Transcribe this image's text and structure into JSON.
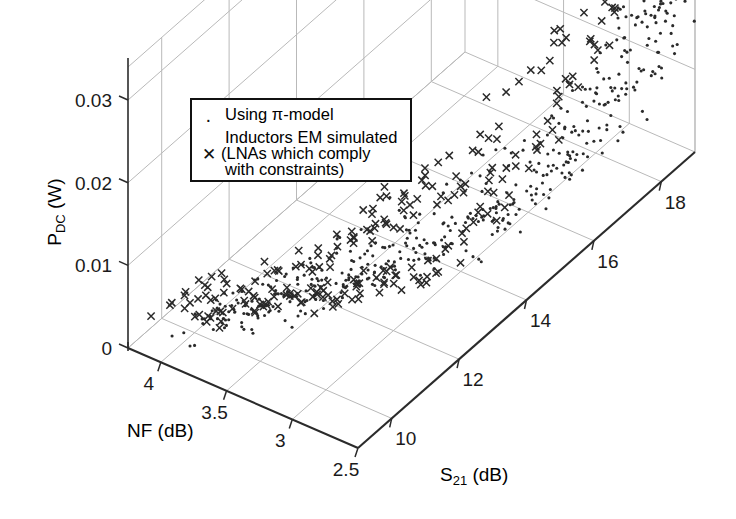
{
  "figure": {
    "kind": "3d-scatter-plot",
    "background": "#ffffff",
    "ink": "#1a1a1a",
    "grid_color": "#b9b9b9",
    "axis_color": "#2b2b2b"
  },
  "axes": {
    "x": {
      "label": "NF (dB)",
      "ticks": [
        "4",
        "3.5",
        "3",
        "2.5"
      ],
      "values": [
        4,
        3.5,
        3,
        2.5
      ],
      "range": [
        4.25,
        2.5
      ]
    },
    "y": {
      "label_main": "S",
      "label_sub": "21",
      "label_unit": " (dB)",
      "label": "S21 (dB)",
      "ticks": [
        "10",
        "12",
        "14",
        "16",
        "18"
      ],
      "values": [
        10,
        12,
        14,
        16,
        18
      ],
      "range": [
        9,
        19
      ]
    },
    "z": {
      "label_main": "P",
      "label_sub": "DC",
      "label_unit": " (W)",
      "label": "PDC (W)",
      "ticks": [
        "0",
        "0.01",
        "0.02",
        "0.03"
      ],
      "values": [
        0,
        0.01,
        0.02,
        0.03
      ],
      "range": [
        0,
        0.034
      ]
    }
  },
  "legend": {
    "box": true,
    "entries": [
      {
        "marker": "dot",
        "text": "Using π-model"
      },
      {
        "marker": "cross",
        "text": "Inductors EM simulated"
      },
      {
        "marker": "none",
        "text": "(LNAs which comply"
      },
      {
        "marker": "none",
        "text": "with constraints)"
      }
    ],
    "line1": "Using π-model",
    "line2": "Inductors EM simulated",
    "line3": "(LNAs which comply",
    "line4": "with constraints)"
  },
  "chart_data": {
    "type": "scatter",
    "projection": "3d",
    "title": "",
    "xlabel": "NF (dB)",
    "ylabel": "S21 (dB)",
    "zlabel": "PDC (W)",
    "xlim": [
      4.25,
      2.5
    ],
    "ylim": [
      9,
      19
    ],
    "zlim": [
      0,
      0.034
    ],
    "grid": true,
    "legend_position": "upper-left-inside",
    "series": [
      {
        "name": "Using π-model",
        "marker": "dot",
        "color": "#2a2a2a",
        "points": [
          [
            3.95,
            10.3,
            0.0008
          ],
          [
            3.9,
            10.6,
            0.0009
          ],
          [
            3.86,
            10.9,
            0.001
          ],
          [
            3.82,
            10.4,
            0.0007
          ],
          [
            3.78,
            11.2,
            0.0011
          ],
          [
            3.74,
            11.5,
            0.0012
          ],
          [
            3.7,
            10.8,
            0.0009
          ],
          [
            3.66,
            11.8,
            0.0013
          ],
          [
            3.62,
            12.1,
            0.0014
          ],
          [
            3.58,
            11.4,
            0.0011
          ],
          [
            3.54,
            12.4,
            0.0015
          ],
          [
            3.5,
            12.7,
            0.0016
          ],
          [
            3.46,
            12.0,
            0.0013
          ],
          [
            3.42,
            13.0,
            0.0017
          ],
          [
            3.38,
            13.3,
            0.0018
          ],
          [
            3.34,
            12.6,
            0.0015
          ],
          [
            3.3,
            13.6,
            0.0019
          ],
          [
            3.26,
            13.9,
            0.002
          ],
          [
            3.22,
            13.2,
            0.0017
          ],
          [
            3.18,
            14.2,
            0.0022
          ],
          [
            3.14,
            14.5,
            0.0024
          ],
          [
            3.1,
            13.8,
            0.0019
          ],
          [
            3.06,
            14.8,
            0.0026
          ],
          [
            3.02,
            15.1,
            0.0029
          ],
          [
            2.98,
            14.4,
            0.0023
          ],
          [
            2.96,
            15.4,
            0.0032
          ],
          [
            2.94,
            15.7,
            0.0036
          ],
          [
            2.92,
            15.0,
            0.0028
          ],
          [
            2.9,
            16.0,
            0.0041
          ],
          [
            2.88,
            16.3,
            0.0047
          ],
          [
            2.86,
            15.6,
            0.0035
          ],
          [
            2.84,
            16.6,
            0.0055
          ],
          [
            2.82,
            16.9,
            0.0064
          ],
          [
            2.8,
            16.2,
            0.0045
          ],
          [
            2.78,
            17.2,
            0.0075
          ],
          [
            2.76,
            17.4,
            0.0086
          ],
          [
            2.74,
            16.8,
            0.0062
          ],
          [
            2.72,
            17.6,
            0.0098
          ],
          [
            2.7,
            17.8,
            0.0112
          ],
          [
            2.68,
            17.1,
            0.0072
          ],
          [
            2.66,
            18.0,
            0.0128
          ],
          [
            2.64,
            18.2,
            0.0145
          ],
          [
            2.62,
            17.5,
            0.009
          ],
          [
            2.6,
            18.3,
            0.0162
          ],
          [
            2.58,
            18.4,
            0.018
          ],
          [
            2.56,
            18.0,
            0.0135
          ],
          [
            2.55,
            18.5,
            0.0198
          ],
          [
            2.54,
            18.6,
            0.0215
          ],
          [
            2.53,
            18.3,
            0.017
          ],
          [
            2.52,
            18.7,
            0.0232
          ],
          [
            2.52,
            18.7,
            0.025
          ],
          [
            2.51,
            18.5,
            0.0205
          ],
          [
            2.51,
            18.8,
            0.0268
          ],
          [
            2.5,
            18.8,
            0.0285
          ],
          [
            2.5,
            18.6,
            0.024
          ],
          [
            2.5,
            18.9,
            0.03
          ],
          [
            2.5,
            18.9,
            0.0312
          ],
          [
            2.51,
            18.7,
            0.0275
          ],
          [
            2.52,
            18.8,
            0.0322
          ],
          [
            2.53,
            18.6,
            0.033
          ],
          [
            3.92,
            11.0,
            0.0012
          ],
          [
            3.84,
            11.6,
            0.0013
          ],
          [
            3.76,
            12.2,
            0.0014
          ],
          [
            3.68,
            12.8,
            0.0016
          ],
          [
            3.6,
            13.4,
            0.0018
          ],
          [
            3.52,
            14.0,
            0.0021
          ],
          [
            3.44,
            14.6,
            0.0025
          ],
          [
            3.36,
            15.2,
            0.003
          ],
          [
            3.28,
            15.8,
            0.0037
          ],
          [
            3.2,
            16.4,
            0.0048
          ],
          [
            3.12,
            16.9,
            0.006
          ],
          [
            3.04,
            17.3,
            0.0076
          ],
          [
            2.97,
            17.7,
            0.0095
          ],
          [
            2.91,
            18.0,
            0.0118
          ],
          [
            2.85,
            18.2,
            0.0142
          ],
          [
            2.79,
            18.4,
            0.0168
          ],
          [
            2.73,
            18.5,
            0.0195
          ],
          [
            2.68,
            18.6,
            0.0222
          ],
          [
            2.63,
            18.7,
            0.0248
          ],
          [
            2.59,
            18.8,
            0.0272
          ],
          [
            3.99,
            10.1,
            0.0006
          ],
          [
            3.93,
            10.2,
            0.0007
          ],
          [
            3.87,
            10.5,
            0.0008
          ],
          [
            3.81,
            10.7,
            0.0008
          ],
          [
            3.75,
            11.1,
            0.001
          ],
          [
            3.69,
            11.3,
            0.001
          ],
          [
            3.63,
            11.7,
            0.0012
          ],
          [
            3.57,
            12.0,
            0.0013
          ],
          [
            3.51,
            12.3,
            0.0014
          ],
          [
            3.45,
            12.5,
            0.0015
          ],
          [
            3.39,
            12.9,
            0.0016
          ],
          [
            3.33,
            13.1,
            0.0017
          ],
          [
            3.27,
            13.5,
            0.0019
          ],
          [
            3.21,
            13.7,
            0.002
          ],
          [
            3.15,
            14.1,
            0.0022
          ],
          [
            3.09,
            14.3,
            0.0023
          ],
          [
            3.03,
            14.7,
            0.0027
          ],
          [
            2.99,
            15.3,
            0.0031
          ],
          [
            2.95,
            15.9,
            0.0039
          ],
          [
            2.93,
            16.5,
            0.0052
          ],
          [
            2.89,
            17.0,
            0.0068
          ],
          [
            2.87,
            17.5,
            0.0089
          ],
          [
            2.83,
            17.9,
            0.011
          ],
          [
            2.81,
            18.1,
            0.0132
          ],
          [
            2.77,
            18.3,
            0.0158
          ],
          [
            2.75,
            18.4,
            0.0185
          ],
          [
            2.71,
            18.5,
            0.021
          ],
          [
            2.69,
            18.6,
            0.0236
          ],
          [
            2.67,
            18.7,
            0.026
          ],
          [
            2.65,
            18.8,
            0.029
          ],
          [
            2.61,
            18.8,
            0.0308
          ],
          [
            2.57,
            18.9,
            0.0326
          ]
        ]
      },
      {
        "name": "Inductors EM simulated (LNAs which comply with constraints)",
        "marker": "cross",
        "color": "#2a2a2a",
        "points": [
          [
            4.22,
            10.2,
            0.001
          ],
          [
            4.15,
            10.3,
            0.0011
          ],
          [
            4.08,
            10.5,
            0.0012
          ],
          [
            4.02,
            10.4,
            0.001
          ],
          [
            3.96,
            10.7,
            0.0013
          ],
          [
            3.92,
            10.6,
            0.0011
          ],
          [
            3.88,
            10.9,
            0.0014
          ],
          [
            3.84,
            10.8,
            0.0012
          ],
          [
            3.8,
            11.1,
            0.0015
          ],
          [
            3.76,
            11.0,
            0.0013
          ],
          [
            3.72,
            11.3,
            0.0016
          ],
          [
            3.68,
            11.2,
            0.0014
          ],
          [
            3.64,
            11.5,
            0.0017
          ],
          [
            3.6,
            11.4,
            0.0015
          ],
          [
            3.56,
            11.7,
            0.0018
          ],
          [
            3.52,
            11.6,
            0.0016
          ],
          [
            3.48,
            11.9,
            0.0019
          ],
          [
            3.44,
            11.8,
            0.0017
          ],
          [
            3.4,
            12.1,
            0.002
          ],
          [
            3.36,
            12.0,
            0.0018
          ],
          [
            3.32,
            12.3,
            0.0022
          ],
          [
            3.28,
            12.2,
            0.0019
          ],
          [
            3.24,
            12.5,
            0.0024
          ],
          [
            3.2,
            12.4,
            0.0021
          ],
          [
            3.16,
            12.8,
            0.0027
          ],
          [
            3.12,
            12.7,
            0.0024
          ],
          [
            3.08,
            13.1,
            0.003
          ],
          [
            3.04,
            13.0,
            0.0026
          ],
          [
            3.0,
            13.4,
            0.0034
          ],
          [
            2.98,
            13.7,
            0.004
          ],
          [
            2.96,
            14.0,
            0.0046
          ],
          [
            2.94,
            14.3,
            0.0053
          ],
          [
            2.92,
            14.6,
            0.0062
          ],
          [
            2.9,
            14.9,
            0.0072
          ],
          [
            2.88,
            15.2,
            0.0084
          ],
          [
            2.86,
            15.5,
            0.0096
          ],
          [
            2.84,
            15.8,
            0.011
          ],
          [
            2.82,
            16.1,
            0.0125
          ],
          [
            2.8,
            16.4,
            0.0142
          ],
          [
            2.78,
            16.6,
            0.0158
          ],
          [
            2.76,
            16.9,
            0.0175
          ],
          [
            2.74,
            17.1,
            0.0192
          ],
          [
            2.72,
            17.3,
            0.021
          ],
          [
            2.7,
            17.5,
            0.0226
          ],
          [
            3.55,
            13.4,
            0.0056
          ],
          [
            3.45,
            13.9,
            0.0068
          ],
          [
            3.35,
            14.2,
            0.0079
          ],
          [
            3.25,
            14.6,
            0.009
          ],
          [
            3.15,
            15.0,
            0.0104
          ],
          [
            3.05,
            15.4,
            0.012
          ],
          [
            3.3,
            13.2,
            0.0098
          ],
          [
            3.18,
            13.6,
            0.0112
          ],
          [
            3.62,
            12.6,
            0.0042
          ],
          [
            3.7,
            12.2,
            0.0035
          ],
          [
            3.5,
            12.9,
            0.005
          ],
          [
            3.4,
            13.0,
            0.006
          ],
          [
            3.1,
            15.8,
            0.0146
          ],
          [
            3.0,
            16.2,
            0.0168
          ],
          [
            2.95,
            16.5,
            0.0185
          ],
          [
            2.91,
            16.8,
            0.0205
          ],
          [
            4.18,
            10.6,
            0.0014
          ],
          [
            4.1,
            10.8,
            0.0016
          ],
          [
            4.04,
            11.0,
            0.0018
          ],
          [
            3.98,
            11.2,
            0.002
          ],
          [
            3.9,
            11.5,
            0.0022
          ],
          [
            3.82,
            11.8,
            0.0024
          ],
          [
            3.74,
            12.0,
            0.0026
          ],
          [
            3.66,
            12.4,
            0.0029
          ],
          [
            3.58,
            12.7,
            0.0033
          ],
          [
            3.5,
            13.1,
            0.0038
          ],
          [
            3.42,
            13.5,
            0.0044
          ],
          [
            3.34,
            13.8,
            0.005
          ],
          [
            3.26,
            14.1,
            0.0058
          ],
          [
            3.22,
            14.4,
            0.0066
          ],
          [
            3.06,
            14.8,
            0.0076
          ],
          [
            2.99,
            15.1,
            0.0088
          ]
        ]
      }
    ]
  }
}
